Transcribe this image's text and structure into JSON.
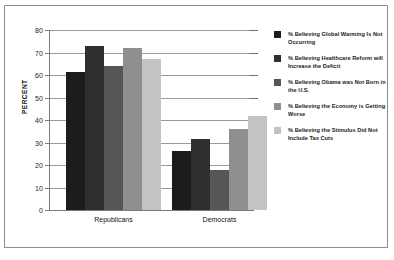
{
  "chart_data": {
    "type": "bar",
    "title": "",
    "xlabel": "",
    "ylabel": "PERCENT",
    "categories": [
      "Republicans",
      "Democrats"
    ],
    "ylim": [
      0,
      80
    ],
    "yticks": [
      0,
      10,
      20,
      30,
      40,
      50,
      60,
      70,
      80
    ],
    "ytick_labels": [
      "0",
      "10",
      "20",
      "30",
      "40",
      "50",
      "60",
      "70",
      "80"
    ],
    "grid": true,
    "legend_position": "right",
    "series": [
      {
        "name": "% Believing Global Warming Is Not Occurring",
        "color": "#1c1c1c",
        "values": [
          61.5,
          26.3
        ]
      },
      {
        "name": "% Believing Healthcare Reform will Increase the Deficit",
        "color": "#2f2f2f",
        "values": [
          73.0,
          31.5
        ]
      },
      {
        "name": "% Believing Obama was Not Born in the U.S.",
        "color": "#565656",
        "values": [
          64.0,
          17.8
        ]
      },
      {
        "name": "% Believing the Economy is Getting Worse",
        "color": "#8f8f8f",
        "values": [
          71.8,
          36.0
        ]
      },
      {
        "name": "% Believing the Stimulus Did Not Include Tax Cuts",
        "color": "#c3c3c3",
        "values": [
          67.0,
          42.0
        ]
      }
    ]
  },
  "axis": {
    "y_title": "PERCENT",
    "tick_0": "0",
    "tick_10": "10",
    "tick_20": "20",
    "tick_30": "30",
    "tick_40": "40",
    "tick_50": "50",
    "tick_60": "60",
    "tick_70": "70",
    "tick_80": "80"
  },
  "categories": {
    "cat_0": "Republicans",
    "cat_1": "Democrats"
  },
  "legend": {
    "item_0": "% Believing Global Warming Is Not Occurring",
    "item_1": "% Believing Healthcare Reform will Increase the Deficit",
    "item_2": "% Believing Obama was Not Born in the U.S.",
    "item_3": "% Believing the Economy is Getting Worse",
    "item_4": "% Believing the Stimulus Did Not Include Tax Cuts"
  }
}
